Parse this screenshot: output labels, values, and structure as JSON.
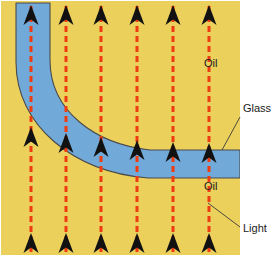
{
  "figure": {
    "canvas": {
      "width": 277,
      "height": 256,
      "background": "#ffffff"
    },
    "regions": {
      "oil": {
        "label": "Oil",
        "color": "#ecd05c",
        "x": 1,
        "y": 1,
        "width": 239,
        "height": 254
      },
      "glass": {
        "label": "Glass",
        "color": "#71a9d8",
        "stroke": "#4a4a4a"
      }
    },
    "labels": [
      {
        "id": "oil-top",
        "text": "Oil",
        "x": 204,
        "y": 62,
        "leader": false
      },
      {
        "id": "glass",
        "text": "Glass",
        "x": 243,
        "y": 108,
        "leader": true,
        "leader_from": [
          240,
          117
        ],
        "leader_to": [
          222,
          148
        ]
      },
      {
        "id": "oil-bottom",
        "text": "Oil",
        "x": 204,
        "y": 185,
        "leader": false
      },
      {
        "id": "light",
        "text": "Light",
        "x": 243,
        "y": 228,
        "leader": true,
        "leader_from": [
          240,
          228
        ],
        "leader_to": [
          208,
          204
        ]
      }
    ],
    "rays": {
      "color": "#ef3b10",
      "dash": "6,4",
      "stroke_width": 3,
      "count": 6,
      "x_positions": [
        31,
        66,
        101,
        137,
        173,
        209
      ],
      "bottom_y": 253,
      "top_y": 4,
      "arrowhead_color": "#111111",
      "arrowheads_per_ray": 3,
      "bottom_arrow_tip_y": 233,
      "top_arrow_tip_y": 5,
      "mid_arrow_tip_y": [
        127,
        133,
        137,
        140,
        142,
        143
      ]
    }
  }
}
